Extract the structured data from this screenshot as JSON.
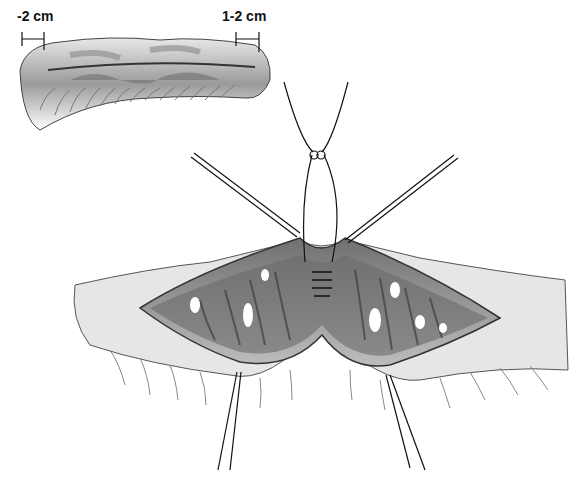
{
  "figure": {
    "type": "surgical-illustration",
    "labels": {
      "left_margin": "-2 cm",
      "right_margin": "1-2 cm"
    },
    "colors": {
      "background": "#ffffff",
      "tissue_dark": "#555555",
      "tissue_mid": "#9a9a9a",
      "tissue_light": "#d8d8d8",
      "line": "#111111"
    }
  }
}
